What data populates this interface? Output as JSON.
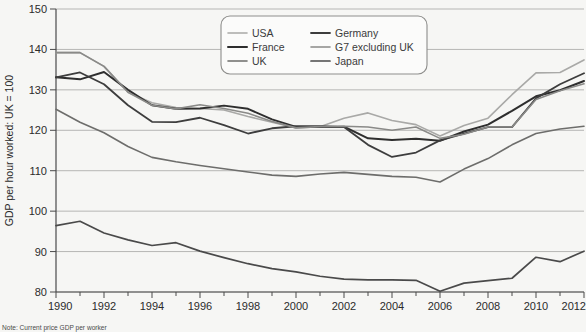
{
  "chart_data": {
    "type": "line",
    "title": "",
    "subtitle": "",
    "xlabel": "",
    "ylabel": "GDP per hour worked: UK = 100",
    "note": "Note: Current price GDP per worker",
    "xlim": [
      1990,
      2012
    ],
    "ylim": [
      80,
      150
    ],
    "yticks": [
      80,
      90,
      100,
      110,
      120,
      130,
      140,
      150
    ],
    "xticks": [
      1990,
      1992,
      1994,
      1996,
      1998,
      2000,
      2002,
      2004,
      2006,
      2008,
      2010,
      2012
    ],
    "xtick_labels": [
      "1990",
      "1992",
      "1994",
      "1996",
      "1998",
      "2000",
      "2002",
      "2004",
      "2006",
      "2008",
      "2010",
      "2012"
    ],
    "ytick_labels": [
      "80",
      "90",
      "100",
      "110",
      "120",
      "130",
      "140",
      "150"
    ],
    "grid": "horizontal",
    "legend_position": "top-center",
    "x": [
      1990,
      1991,
      1992,
      1993,
      1994,
      1995,
      1996,
      1997,
      1998,
      1999,
      2000,
      2001,
      2002,
      2003,
      2004,
      2005,
      2006,
      2007,
      2008,
      2009,
      2010,
      2011,
      2012
    ],
    "series": [
      {
        "name": "USA",
        "color": "#a9a9a7",
        "width": 1.6,
        "values": [
          139.2,
          139.2,
          135.8,
          129.4,
          126.8,
          125.6,
          125.4,
          125.0,
          123.4,
          122.0,
          120.6,
          120.9,
          123.0,
          124.3,
          122.4,
          121.4,
          118.6,
          121.2,
          123.0,
          128.8,
          134.2,
          134.3,
          137.4
        ]
      },
      {
        "name": "France",
        "color": "#2e2e2e",
        "width": 2.0,
        "values": [
          133.1,
          132.6,
          134.4,
          130.0,
          126.2,
          125.3,
          125.4,
          126.1,
          125.3,
          122.7,
          120.8,
          120.8,
          120.9,
          118.0,
          117.6,
          117.9,
          117.4,
          119.7,
          121.4,
          124.8,
          128.4,
          129.9,
          132.2
        ]
      },
      {
        "name": "UK",
        "color": "#6d6d6b",
        "width": 1.6,
        "values": [
          125.2,
          122.0,
          119.4,
          116.0,
          113.3,
          112.2,
          111.3,
          110.5,
          109.7,
          108.9,
          108.6,
          109.2,
          109.6,
          109.1,
          108.6,
          108.4,
          107.2,
          110.4,
          113.0,
          116.4,
          119.2,
          120.3,
          121.0
        ]
      },
      {
        "name": "Germany",
        "color": "#3d3d3d",
        "width": 1.8,
        "values": [
          133.1,
          134.3,
          131.4,
          126.2,
          122.1,
          122.0,
          123.1,
          121.3,
          119.2,
          120.5,
          121.0,
          121.0,
          120.8,
          116.4,
          113.4,
          114.5,
          117.5,
          119.2,
          120.8,
          120.8,
          127.9,
          131.4,
          134.1
        ]
      },
      {
        "name": "G7 excluding UK",
        "color": "#8a8a88",
        "width": 1.6,
        "values": [
          139.2,
          139.2,
          135.8,
          129.4,
          126.2,
          125.3,
          126.3,
          125.4,
          124.2,
          122.2,
          120.6,
          120.9,
          121.0,
          120.8,
          120.0,
          120.8,
          118.0,
          119.0,
          120.8,
          120.8,
          127.6,
          129.8,
          131.5
        ]
      },
      {
        "name": "Japan",
        "color": "#4a4a4a",
        "width": 1.7,
        "values": [
          96.4,
          97.5,
          94.6,
          92.9,
          91.5,
          92.2,
          90.1,
          88.5,
          87.0,
          85.8,
          85.0,
          83.9,
          83.2,
          83.0,
          83.0,
          82.9,
          80.2,
          82.2,
          82.8,
          83.4,
          88.6,
          87.5,
          90.1
        ]
      }
    ]
  },
  "legend": {
    "entries": [
      {
        "label": "USA"
      },
      {
        "label": "Germany"
      },
      {
        "label": "France"
      },
      {
        "label": "G7 excluding UK"
      },
      {
        "label": "UK"
      },
      {
        "label": "Japan"
      }
    ]
  }
}
